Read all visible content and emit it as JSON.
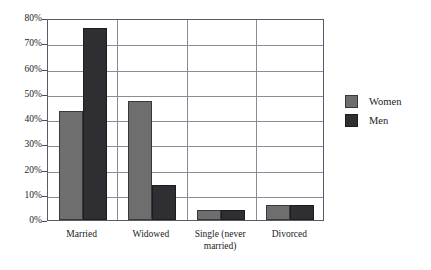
{
  "chart_data": {
    "type": "bar",
    "title": "",
    "subtitle": "",
    "xlabel": "",
    "ylabel": "",
    "categories": [
      "Married",
      "Widowed",
      "Single (never married)",
      "Divorced"
    ],
    "series": [
      {
        "name": "Women",
        "color": "#6e6e6e",
        "values": [
          43,
          47,
          4,
          6
        ]
      },
      {
        "name": "Men",
        "color": "#2f2f33",
        "values": [
          76,
          14,
          4,
          6
        ]
      }
    ],
    "ylim": [
      0,
      80
    ],
    "y_ticks": [
      0,
      10,
      20,
      30,
      40,
      50,
      60,
      70,
      80
    ],
    "y_tick_labels": [
      "0%",
      "10%",
      "20%",
      "30%",
      "40%",
      "50%",
      "60%",
      "70%",
      "80%"
    ],
    "y_tick_suffix": "%",
    "grid": true,
    "legend_position": "right",
    "legend_entries": [
      "Women",
      "Men"
    ]
  },
  "category_label_lines": [
    [
      "Married"
    ],
    [
      "Widowed"
    ],
    [
      "Single (never",
      "married)"
    ],
    [
      "Divorced"
    ]
  ]
}
